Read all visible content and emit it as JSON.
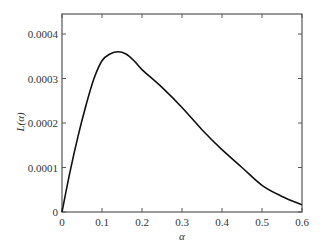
{
  "chart_data": {
    "type": "line",
    "title": "",
    "xlabel": "α",
    "ylabel": "L(α)",
    "xlim": [
      0,
      0.6
    ],
    "ylim": [
      0,
      0.00043
    ],
    "grid": false,
    "legend": null,
    "x_ticks": [
      "0",
      "0.1",
      "0.2",
      "0.3",
      "0.4",
      "0.5",
      "0.6"
    ],
    "y_ticks": [
      "0",
      "0.0001",
      "0.0002",
      "0.0003",
      "0.0004"
    ],
    "series": [
      {
        "name": "L(α)",
        "color": "#111111",
        "x": [
          0,
          0.02,
          0.04,
          0.06,
          0.08,
          0.1,
          0.12,
          0.14,
          0.16,
          0.18,
          0.2,
          0.25,
          0.3,
          0.35,
          0.4,
          0.45,
          0.5,
          0.55,
          0.6
        ],
        "y": [
          0,
          9e-05,
          0.00017,
          0.00024,
          0.0003,
          0.00034,
          0.000355,
          0.00036,
          0.000355,
          0.00034,
          0.00032,
          0.00028,
          0.000235,
          0.000185,
          0.00014,
          0.0001,
          6e-05,
          3.5e-05,
          1.6e-05
        ]
      }
    ]
  }
}
